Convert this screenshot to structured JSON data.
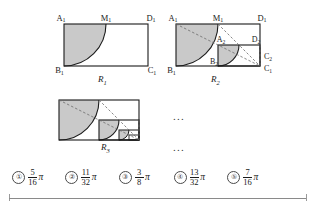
{
  "figure": {
    "type": "geometry-sequence-diagram",
    "shade_color": "#c9c9c9",
    "stroke_color": "#1b1b1b",
    "dashed_color": "#6a6a6a",
    "panels": [
      {
        "caption": "R",
        "caption_sub": "1",
        "vertex_labels": [
          {
            "text": "A",
            "sub": "1"
          },
          {
            "text": "M",
            "sub": "1"
          },
          {
            "text": "D",
            "sub": "1"
          },
          {
            "text": "B",
            "sub": "1"
          },
          {
            "text": "C",
            "sub": "1"
          }
        ]
      },
      {
        "caption": "R",
        "caption_sub": "2",
        "vertex_labels": [
          {
            "text": "A",
            "sub": "1"
          },
          {
            "text": "M",
            "sub": "1"
          },
          {
            "text": "D",
            "sub": "1"
          },
          {
            "text": "B",
            "sub": "1"
          },
          {
            "text": "C",
            "sub": "1"
          },
          {
            "text": "A",
            "sub": "2"
          },
          {
            "text": "B",
            "sub": "2"
          },
          {
            "text": "D",
            "sub": "2"
          },
          {
            "text": "C",
            "sub": "2"
          }
        ]
      },
      {
        "caption": "R",
        "caption_sub": "3",
        "vertex_labels": []
      }
    ],
    "ellipses": [
      "...",
      "..."
    ]
  },
  "choices": [
    {
      "number": "①",
      "numerator": "5",
      "denominator": "16",
      "symbol": "π"
    },
    {
      "number": "②",
      "numerator": "11",
      "denominator": "32",
      "symbol": "π"
    },
    {
      "number": "③",
      "numerator": "3",
      "denominator": "8",
      "symbol": "π"
    },
    {
      "number": "④",
      "numerator": "13",
      "denominator": "32",
      "symbol": "π"
    },
    {
      "number": "⑤",
      "numerator": "7",
      "denominator": "16",
      "symbol": "π"
    }
  ]
}
